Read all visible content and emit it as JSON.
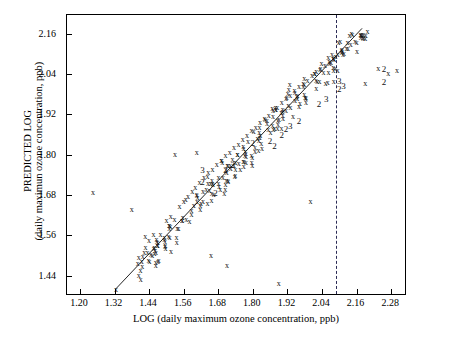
{
  "chart_data": {
    "type": "scatter",
    "title": "",
    "xlabel": "LOG (daily maximum ozone concentration,  ppb)",
    "ylabel_line1": "PREDICTED LOG",
    "ylabel_line2": "(daily maximun ozone concentration,  ppb)",
    "xlim": [
      1.155,
      2.335
    ],
    "ylim": [
      1.38,
      2.215
    ],
    "xticks": [
      "1.20",
      "1.32",
      "1.44",
      "1.56",
      "1.68",
      "1.80",
      "1.92",
      "2.04",
      "2.16",
      "2.28"
    ],
    "xtickvals": [
      1.2,
      1.32,
      1.44,
      1.56,
      1.68,
      1.8,
      1.92,
      2.04,
      2.16,
      2.28
    ],
    "yticks": [
      "1.44",
      "1.56",
      "1.68",
      "1.80",
      "1.92",
      "2.04",
      "2.16"
    ],
    "ytickvals": [
      1.44,
      1.56,
      1.68,
      1.8,
      1.92,
      2.04,
      2.16
    ],
    "grid": false,
    "legend": null,
    "marker_symbol": "x",
    "reference_line": {
      "type": "identity-fit",
      "x0": 1.325,
      "y0": 1.395,
      "x1": 2.185,
      "y1": 2.175,
      "color": "#222222"
    },
    "vertical_dashed_line": {
      "x": 2.09,
      "color": "#2b2b55",
      "style": "dashed"
    },
    "points": [
      {
        "x": 1.325,
        "y": 1.398,
        "label": "x"
      },
      {
        "x": 1.44,
        "y": 1.545,
        "label": "x"
      },
      {
        "x": 1.455,
        "y": 1.56,
        "label": "x"
      },
      {
        "x": 1.5,
        "y": 1.603,
        "label": "x"
      },
      {
        "x": 1.515,
        "y": 1.615,
        "label": "x"
      },
      {
        "x": 1.545,
        "y": 1.645,
        "label": "x"
      },
      {
        "x": 1.56,
        "y": 1.66,
        "label": "x"
      },
      {
        "x": 1.575,
        "y": 1.675,
        "label": "x"
      },
      {
        "x": 1.59,
        "y": 1.69,
        "label": "x"
      },
      {
        "x": 1.6,
        "y": 1.7,
        "label": "x"
      },
      {
        "x": 1.615,
        "y": 1.715,
        "label": "x"
      },
      {
        "x": 1.63,
        "y": 1.73,
        "label": "x"
      },
      {
        "x": 1.645,
        "y": 1.745,
        "label": "x"
      },
      {
        "x": 1.66,
        "y": 1.755,
        "label": "x"
      },
      {
        "x": 1.675,
        "y": 1.77,
        "label": "x"
      },
      {
        "x": 1.69,
        "y": 1.78,
        "label": "x"
      },
      {
        "x": 1.705,
        "y": 1.795,
        "label": "x"
      },
      {
        "x": 1.72,
        "y": 1.805,
        "label": "x"
      },
      {
        "x": 1.735,
        "y": 1.82,
        "label": "x"
      },
      {
        "x": 1.75,
        "y": 1.83,
        "label": "x"
      },
      {
        "x": 1.765,
        "y": 1.845,
        "label": "x"
      },
      {
        "x": 1.78,
        "y": 1.855,
        "label": "x"
      },
      {
        "x": 1.795,
        "y": 1.87,
        "label": "x"
      },
      {
        "x": 1.81,
        "y": 1.88,
        "label": "x"
      },
      {
        "x": 1.825,
        "y": 1.895,
        "label": "x"
      },
      {
        "x": 1.84,
        "y": 1.905,
        "label": "x"
      },
      {
        "x": 1.855,
        "y": 1.915,
        "label": "x"
      },
      {
        "x": 1.87,
        "y": 1.93,
        "label": "x"
      },
      {
        "x": 1.885,
        "y": 1.94,
        "label": "x"
      },
      {
        "x": 1.9,
        "y": 1.955,
        "label": "x"
      },
      {
        "x": 1.915,
        "y": 1.965,
        "label": "x"
      },
      {
        "x": 1.93,
        "y": 1.975,
        "label": "x"
      },
      {
        "x": 1.945,
        "y": 1.99,
        "label": "x"
      },
      {
        "x": 1.96,
        "y": 2.0,
        "label": "x"
      },
      {
        "x": 1.975,
        "y": 2.01,
        "label": "x"
      },
      {
        "x": 1.99,
        "y": 2.02,
        "label": "x"
      },
      {
        "x": 2.005,
        "y": 2.035,
        "label": "x"
      },
      {
        "x": 2.02,
        "y": 2.045,
        "label": "x"
      },
      {
        "x": 2.035,
        "y": 2.055,
        "label": "x"
      },
      {
        "x": 2.05,
        "y": 2.065,
        "label": "x"
      },
      {
        "x": 2.065,
        "y": 2.075,
        "label": "x"
      },
      {
        "x": 2.08,
        "y": 2.085,
        "label": "x"
      },
      {
        "x": 2.095,
        "y": 2.095,
        "label": "x"
      },
      {
        "x": 2.11,
        "y": 2.105,
        "label": "x"
      },
      {
        "x": 2.125,
        "y": 2.115,
        "label": "x"
      },
      {
        "x": 2.14,
        "y": 2.125,
        "label": "x"
      },
      {
        "x": 2.155,
        "y": 2.135,
        "label": "x"
      }
    ]
  },
  "figure": {
    "background": "#ffffff",
    "axis_color": "#000000",
    "point_color": "#111111"
  }
}
